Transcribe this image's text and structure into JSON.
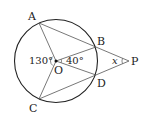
{
  "diagram": {
    "type": "geometry-circle",
    "points": {
      "A": {
        "label": "A"
      },
      "B": {
        "label": "B"
      },
      "C": {
        "label": "C"
      },
      "D": {
        "label": "D"
      },
      "O": {
        "label": "O"
      },
      "P": {
        "label": "P"
      }
    },
    "angles": {
      "AOC": {
        "label": "130°"
      },
      "BOD": {
        "label": "40°"
      },
      "BPD": {
        "label": "x"
      }
    },
    "colors": {
      "circle": "#222222",
      "lines": "#555555",
      "text": "#222222"
    }
  }
}
